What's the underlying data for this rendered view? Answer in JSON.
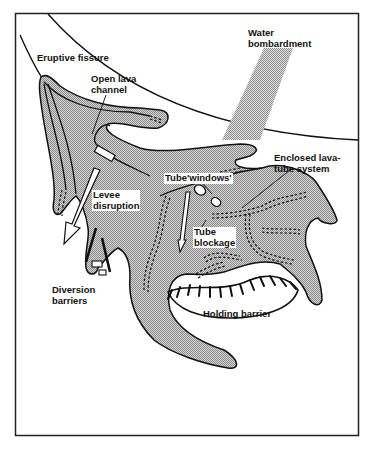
{
  "figure": {
    "type": "schematic diagram",
    "colors": {
      "frame": "#222222",
      "lava_fill": "#b8b8b8",
      "lava_outline": "#111111",
      "water_stipple": "#999999",
      "background": "#ffffff"
    }
  },
  "labels": {
    "eruptive_fissure": "Eruptive fissure",
    "open_lava_channel_1": "Open lava",
    "open_lava_channel_2": "channel",
    "water_bombardment_1": "Water",
    "water_bombardment_2": "bombardment",
    "enclosed_tube_1": "Enclosed lava-",
    "enclosed_tube_2": "tube system",
    "tube_windows": "Tube'windows'",
    "levee_disruption_1": "Levee",
    "levee_disruption_2": "disruption",
    "tube_blockage_1": "Tube",
    "tube_blockage_2": "blockage",
    "diversion_barriers_1": "Diversion",
    "diversion_barriers_2": "barriers",
    "holding_barrier": "Holding barrier"
  }
}
